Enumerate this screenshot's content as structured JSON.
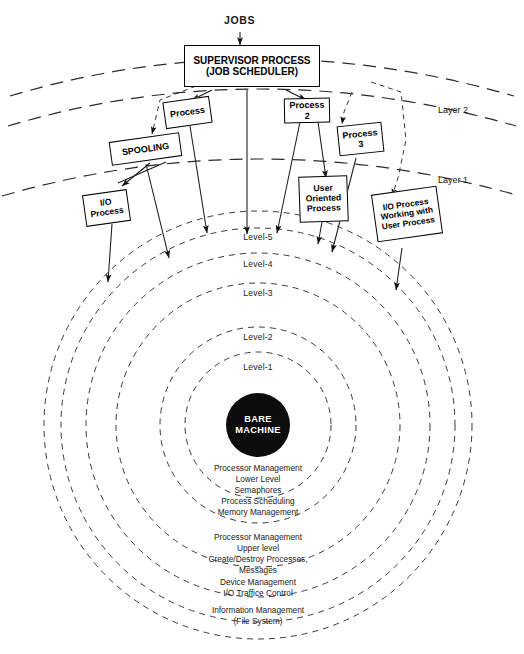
{
  "diagram": {
    "jobs_label": "JOBS",
    "supervisor": {
      "line1": "SUPERVISOR PROCESS",
      "line2": "(JOB SCHEDULER)"
    },
    "layers": [
      {
        "id": "layer2",
        "label": "Layer 2"
      },
      {
        "id": "layer1",
        "label": "Layer 1"
      }
    ],
    "boxes": [
      {
        "id": "process",
        "lines": [
          "Process"
        ]
      },
      {
        "id": "spooling",
        "lines": [
          "SPOOLING"
        ]
      },
      {
        "id": "io-process",
        "lines": [
          "I/O",
          "Process"
        ]
      },
      {
        "id": "process-2",
        "lines": [
          "Process",
          "2"
        ]
      },
      {
        "id": "process-3",
        "lines": [
          "Process",
          "3"
        ]
      },
      {
        "id": "user-oriented-process",
        "lines": [
          "User",
          "Oriented",
          "Process"
        ]
      },
      {
        "id": "io-process-user",
        "lines": [
          "I/O  Process",
          "Working  with",
          "User Process"
        ]
      }
    ],
    "rings": [
      {
        "id": "level-5",
        "label": "Level-5"
      },
      {
        "id": "level-4",
        "label": "Level-4"
      },
      {
        "id": "level-3",
        "label": "Level-3"
      },
      {
        "id": "level-2",
        "label": "Level-2"
      },
      {
        "id": "level-1",
        "label": "Level-1"
      }
    ],
    "core": {
      "line1": "BARE",
      "line2": "MACHINE",
      "color": "#0d0d0d"
    },
    "descriptions": [
      {
        "id": "level-1-desc",
        "lines": [
          "Processor Management",
          "Lower Level",
          "Semaphores",
          "Process Scheduling"
        ]
      },
      {
        "id": "level-2-desc",
        "lines": [
          "Memory  Management"
        ]
      },
      {
        "id": "level-3-desc",
        "lines": [
          "Processor  Management",
          "Upper level",
          "Create/Destroy  Processes,",
          "Messages"
        ]
      },
      {
        "id": "level-4-desc",
        "lines": [
          "Device  Management",
          "I/O Traffice  Control"
        ]
      },
      {
        "id": "level-5-desc",
        "lines": [
          "Information  Management",
          "(File System)"
        ]
      }
    ],
    "colors": {
      "line": "#1a1a1a",
      "dash": "#3a3a3a",
      "core": "#0d0d0d"
    }
  }
}
